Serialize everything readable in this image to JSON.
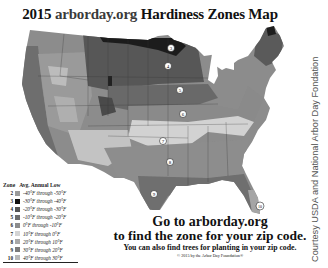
{
  "title": {
    "year": "2015",
    "site": "arborday.org",
    "rest": "Hardiness Zones Map"
  },
  "legend": {
    "header_zone": "Zone",
    "header_range": "Avg. Annual Low",
    "items": [
      {
        "zone": "2",
        "range": "-40°F through -50°F",
        "color": "#9a9a9a"
      },
      {
        "zone": "3",
        "range": "-30°F through -40°F",
        "color": "#111111"
      },
      {
        "zone": "4",
        "range": "-20°F through -30°F",
        "color": "#555555"
      },
      {
        "zone": "5",
        "range": "-10°F through -20°F",
        "color": "#6e6e6e"
      },
      {
        "zone": "6",
        "range": "0°F through -10°F",
        "color": "#8c8c8c"
      },
      {
        "zone": "7",
        "range": "10°F through 0°F",
        "color": "#d4d4d4"
      },
      {
        "zone": "8",
        "range": "20°F through 10°F",
        "color": "#a8a8a8"
      },
      {
        "zone": "9",
        "range": "30°F through 20°F",
        "color": "#7a7a7a"
      },
      {
        "zone": "10",
        "range": "40°F through 30°F",
        "color": "#b8b8b8"
      }
    ]
  },
  "map_labels": [
    {
      "zone": "3",
      "x": 163,
      "y": 22
    },
    {
      "zone": "4",
      "x": 160,
      "y": 40
    },
    {
      "zone": "5",
      "x": 172,
      "y": 64
    },
    {
      "zone": "6",
      "x": 175,
      "y": 88
    },
    {
      "zone": "7",
      "x": 155,
      "y": 115
    },
    {
      "zone": "8",
      "x": 162,
      "y": 136
    },
    {
      "zone": "9",
      "x": 146,
      "y": 168
    },
    {
      "zone": "10",
      "x": 252,
      "y": 180
    }
  ],
  "cta": {
    "line1": "Go to arborday.org",
    "line2": "to find the zone for your zip code.",
    "line3": "You can also find trees for planting in your zip code.",
    "line4": "© 2015 by the Arbor Day Foundation®"
  },
  "credit": "Courtesy USDA and National Arbor Day Fondation"
}
